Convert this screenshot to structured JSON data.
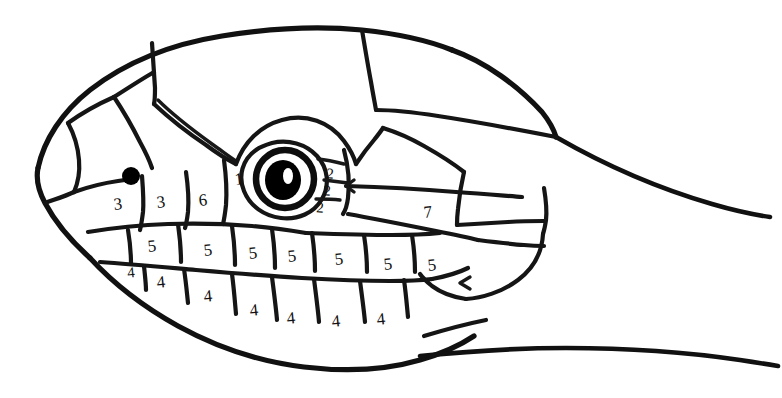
{
  "figure": {
    "kind": "line-drawing",
    "background_color": "#ffffff",
    "ink_color": "#111111"
  },
  "legend_key": {
    "1": "loreal / preocular region scale",
    "2": "postocular scales",
    "3": "nasal and internasal scales",
    "4": "infralabial (lower lip) scales",
    "5": "supralabial (upper lip) scales",
    "6": "preocular scale",
    "7": "temporal scale"
  },
  "labels": [
    {
      "id": "lbl-nasal-1",
      "text": "3",
      "x": 118,
      "y": 204,
      "group": "nasal",
      "tilt": "a"
    },
    {
      "id": "lbl-nasal-2",
      "text": "3",
      "x": 161,
      "y": 202,
      "group": "nasal",
      "tilt": "a"
    },
    {
      "id": "lbl-preocular",
      "text": "6",
      "x": 203,
      "y": 200,
      "group": "preocular",
      "tilt": "a"
    },
    {
      "id": "lbl-loreal",
      "text": "1",
      "x": 239,
      "y": 179,
      "group": "loreal",
      "tilt": "a"
    },
    {
      "id": "lbl-postocular-1",
      "text": "2",
      "x": 330,
      "y": 174,
      "group": "postocular",
      "tilt": "b"
    },
    {
      "id": "lbl-postocular-2",
      "text": "2",
      "x": 327,
      "y": 191,
      "group": "postocular",
      "tilt": "b"
    },
    {
      "id": "lbl-postocular-3",
      "text": "2",
      "x": 320,
      "y": 208,
      "group": "postocular",
      "tilt": "b"
    },
    {
      "id": "lbl-temporal",
      "text": "7",
      "x": 428,
      "y": 212,
      "group": "temporal",
      "tilt": "a"
    },
    {
      "id": "lbl-supralabial-1",
      "text": "5",
      "x": 152,
      "y": 246,
      "group": "supralabial",
      "tilt": "a"
    },
    {
      "id": "lbl-supralabial-2",
      "text": "5",
      "x": 208,
      "y": 250,
      "group": "supralabial",
      "tilt": "a"
    },
    {
      "id": "lbl-supralabial-3",
      "text": "5",
      "x": 253,
      "y": 253,
      "group": "supralabial",
      "tilt": "a"
    },
    {
      "id": "lbl-supralabial-4",
      "text": "5",
      "x": 292,
      "y": 256,
      "group": "supralabial",
      "tilt": "a"
    },
    {
      "id": "lbl-supralabial-5",
      "text": "5",
      "x": 339,
      "y": 259,
      "group": "supralabial",
      "tilt": "a"
    },
    {
      "id": "lbl-supralabial-6",
      "text": "5",
      "x": 388,
      "y": 264,
      "group": "supralabial",
      "tilt": "a"
    },
    {
      "id": "lbl-supralabial-7",
      "text": "5",
      "x": 432,
      "y": 265,
      "group": "supralabial",
      "tilt": "a"
    },
    {
      "id": "lbl-infralabial-1",
      "text": "4",
      "x": 131,
      "y": 273,
      "group": "infralabial",
      "tilt": "a"
    },
    {
      "id": "lbl-infralabial-2",
      "text": "4",
      "x": 161,
      "y": 282,
      "group": "infralabial",
      "tilt": "a"
    },
    {
      "id": "lbl-infralabial-3",
      "text": "4",
      "x": 208,
      "y": 296,
      "group": "infralabial",
      "tilt": "a"
    },
    {
      "id": "lbl-infralabial-4",
      "text": "4",
      "x": 254,
      "y": 310,
      "group": "infralabial",
      "tilt": "a"
    },
    {
      "id": "lbl-infralabial-5",
      "text": "4",
      "x": 291,
      "y": 318,
      "group": "infralabial",
      "tilt": "a"
    },
    {
      "id": "lbl-infralabial-6",
      "text": "4",
      "x": 336,
      "y": 321,
      "group": "infralabial",
      "tilt": "a"
    },
    {
      "id": "lbl-infralabial-7",
      "text": "4",
      "x": 381,
      "y": 319,
      "group": "infralabial",
      "tilt": "a"
    }
  ],
  "eye": {
    "name": "eye",
    "center_x": 285,
    "center_y": 179,
    "outer_radius": 29,
    "pupil_radius": 18,
    "pupil_color": "#000000",
    "ring_color": "#ffffff"
  },
  "nostril": {
    "name": "nostril",
    "center_x": 131,
    "center_y": 176,
    "radius": 8,
    "color": "#000000"
  }
}
